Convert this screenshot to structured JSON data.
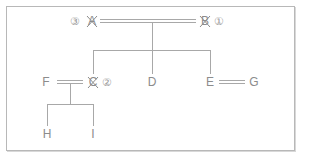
{
  "diagram": {
    "type": "family-tree",
    "colors": {
      "line": "#a0a0a0",
      "text": "#8c8c8c",
      "border": "#b8b8b8"
    },
    "nodes": [
      {
        "id": "A",
        "label": "A",
        "deceased": true,
        "order_marker": "③"
      },
      {
        "id": "B",
        "label": "B",
        "deceased": true,
        "order_marker": "①"
      },
      {
        "id": "C",
        "label": "C",
        "deceased": true,
        "order_marker": "②"
      },
      {
        "id": "D",
        "label": "D",
        "deceased": false
      },
      {
        "id": "E",
        "label": "E",
        "deceased": false
      },
      {
        "id": "F",
        "label": "F",
        "deceased": false
      },
      {
        "id": "G",
        "label": "G",
        "deceased": false
      },
      {
        "id": "H",
        "label": "H",
        "deceased": false
      },
      {
        "id": "I",
        "label": "I",
        "deceased": false
      }
    ],
    "marriages": [
      {
        "spouses": [
          "A",
          "B"
        ],
        "children": [
          "C",
          "D",
          "E"
        ]
      },
      {
        "spouses": [
          "F",
          "C"
        ],
        "children": [
          "H",
          "I"
        ]
      },
      {
        "spouses": [
          "E",
          "G"
        ],
        "children": []
      }
    ]
  }
}
